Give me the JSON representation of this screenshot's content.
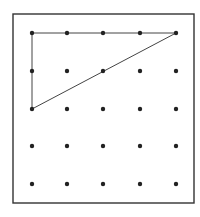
{
  "diagram": {
    "type": "geoboard-grid",
    "rows": 5,
    "cols": 5,
    "frame": {
      "x": 13,
      "y": 14,
      "width": 181,
      "height": 189,
      "stroke": "#333333"
    },
    "dot_xs": [
      32,
      67,
      103,
      140,
      176
    ],
    "dot_ys": [
      33,
      71,
      109,
      146,
      184
    ],
    "dot_color": "#222222",
    "dot_radius": 2.2,
    "shape": {
      "name": "right-triangle",
      "vertices_grid": [
        [
          0,
          0
        ],
        [
          4,
          0
        ],
        [
          0,
          2
        ]
      ],
      "stroke": "#444444"
    }
  }
}
